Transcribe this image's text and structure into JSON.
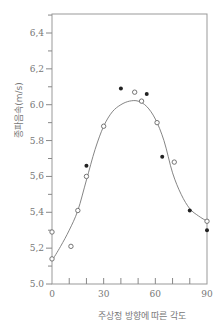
{
  "chart_data": {
    "type": "scatter",
    "title": "",
    "xlabel": "주상정 방향에 따른 각도",
    "ylabel": "종파음속(m/s)",
    "xlim": [
      0,
      90
    ],
    "ylim": [
      5.0,
      6.5
    ],
    "x_ticks": [
      0,
      30,
      60,
      90
    ],
    "x_tick_labels": [
      "0",
      "30",
      "60",
      "90"
    ],
    "x_minor_ticks": [
      10,
      20,
      40,
      50,
      70,
      80
    ],
    "y_ticks": [
      5.0,
      5.2,
      5.4,
      5.6,
      5.8,
      6.0,
      6.2,
      6.4
    ],
    "y_tick_labels": [
      "5.0",
      "5,2",
      "5,4",
      "5,6",
      "5.8",
      "6.0",
      "6,2",
      "6,4"
    ],
    "grid": false,
    "legend": null,
    "series": [
      {
        "name": "open circles",
        "marker": "open-circle",
        "points": [
          [
            0,
            5.14
          ],
          [
            0,
            5.29
          ],
          [
            11,
            5.21
          ],
          [
            15,
            5.41
          ],
          [
            20,
            5.6
          ],
          [
            30,
            5.88
          ],
          [
            48,
            6.07
          ],
          [
            52,
            6.02
          ],
          [
            61,
            5.9
          ],
          [
            71,
            5.68
          ],
          [
            90,
            5.35
          ]
        ]
      },
      {
        "name": "filled circles",
        "marker": "filled-circle",
        "points": [
          [
            20,
            5.66
          ],
          [
            40,
            6.09
          ],
          [
            55,
            6.06
          ],
          [
            64,
            5.71
          ],
          [
            80,
            5.41
          ],
          [
            90,
            5.3
          ]
        ]
      },
      {
        "name": "fitted curve",
        "marker": "line",
        "points": [
          [
            0,
            5.13
          ],
          [
            5,
            5.21
          ],
          [
            10,
            5.3
          ],
          [
            15,
            5.41
          ],
          [
            20,
            5.58
          ],
          [
            25,
            5.75
          ],
          [
            30,
            5.88
          ],
          [
            35,
            5.96
          ],
          [
            40,
            6.0
          ],
          [
            45,
            6.02
          ],
          [
            50,
            6.02
          ],
          [
            55,
            5.99
          ],
          [
            60,
            5.92
          ],
          [
            65,
            5.8
          ],
          [
            70,
            5.62
          ],
          [
            75,
            5.5
          ],
          [
            80,
            5.42
          ],
          [
            85,
            5.38
          ],
          [
            90,
            5.35
          ]
        ]
      }
    ]
  }
}
